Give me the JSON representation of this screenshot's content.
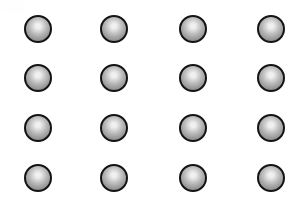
{
  "image": {
    "title": "Grid of shaded spheres",
    "background_color": "#ffffff",
    "width": 301,
    "height": 200
  },
  "grid": {
    "rows": 4,
    "columns": 4,
    "count": 16,
    "column_centers_x": [
      38,
      114,
      193,
      271
    ],
    "row_centers_y": [
      29,
      78,
      128,
      178
    ],
    "sphere_diameter": 28
  },
  "sphere_style": {
    "outline_color": "#141414",
    "outline_width": 2,
    "highlight_color": "#f0f0f0",
    "midtone_color": "#b8b8b8",
    "edge_color": "#6f6f6f",
    "highlight_position": "50% 38%",
    "shape": "circle"
  },
  "spheres": [
    {
      "id": "sphere-r1-c1",
      "row": 1,
      "col": 1,
      "cx": 38,
      "cy": 29,
      "d": 28
    },
    {
      "id": "sphere-r1-c2",
      "row": 1,
      "col": 2,
      "cx": 114,
      "cy": 29,
      "d": 28
    },
    {
      "id": "sphere-r1-c3",
      "row": 1,
      "col": 3,
      "cx": 193,
      "cy": 29,
      "d": 28
    },
    {
      "id": "sphere-r1-c4",
      "row": 1,
      "col": 4,
      "cx": 271,
      "cy": 29,
      "d": 28
    },
    {
      "id": "sphere-r2-c1",
      "row": 2,
      "col": 1,
      "cx": 38,
      "cy": 78,
      "d": 28
    },
    {
      "id": "sphere-r2-c2",
      "row": 2,
      "col": 2,
      "cx": 114,
      "cy": 78,
      "d": 28
    },
    {
      "id": "sphere-r2-c3",
      "row": 2,
      "col": 3,
      "cx": 193,
      "cy": 78,
      "d": 28
    },
    {
      "id": "sphere-r2-c4",
      "row": 2,
      "col": 4,
      "cx": 271,
      "cy": 78,
      "d": 28
    },
    {
      "id": "sphere-r3-c1",
      "row": 3,
      "col": 1,
      "cx": 38,
      "cy": 128,
      "d": 28
    },
    {
      "id": "sphere-r3-c2",
      "row": 3,
      "col": 2,
      "cx": 114,
      "cy": 128,
      "d": 28
    },
    {
      "id": "sphere-r3-c3",
      "row": 3,
      "col": 3,
      "cx": 193,
      "cy": 128,
      "d": 28
    },
    {
      "id": "sphere-r3-c4",
      "row": 3,
      "col": 4,
      "cx": 271,
      "cy": 128,
      "d": 28
    },
    {
      "id": "sphere-r4-c1",
      "row": 4,
      "col": 1,
      "cx": 38,
      "cy": 178,
      "d": 28
    },
    {
      "id": "sphere-r4-c2",
      "row": 4,
      "col": 2,
      "cx": 114,
      "cy": 178,
      "d": 28
    },
    {
      "id": "sphere-r4-c3",
      "row": 4,
      "col": 3,
      "cx": 193,
      "cy": 178,
      "d": 28
    },
    {
      "id": "sphere-r4-c4",
      "row": 4,
      "col": 4,
      "cx": 271,
      "cy": 178,
      "d": 28
    }
  ]
}
